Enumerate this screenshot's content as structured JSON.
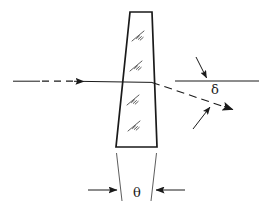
{
  "figure": {
    "kind": "optical-wedge-prism-ray-diagram",
    "canvas": {
      "width": 266,
      "height": 210,
      "background": "#ffffff"
    },
    "stroke_color": "#1a1a1a",
    "labels": {
      "deviation_angle": "δ",
      "wedge_angle": "θ"
    },
    "elements": {
      "prism": {
        "name": "wedge-prism",
        "outline_points": "130,12 152,12 157,147 116,147",
        "stroke_width": 1.6,
        "fill": "none"
      },
      "hatch_marks": [
        {
          "x": 138,
          "y": 36
        },
        {
          "x": 136,
          "y": 66
        },
        {
          "x": 133,
          "y": 100
        },
        {
          "x": 134,
          "y": 126
        }
      ],
      "incident_ray": {
        "name": "incident-ray",
        "solid_start": {
          "x": 13,
          "y": 81
        },
        "solid_end": {
          "x": 40,
          "y": 81
        },
        "dashed_start": {
          "x": 42,
          "y": 81
        },
        "dashed_end": {
          "x": 72,
          "y": 81
        },
        "arrow_tip": {
          "x": 84,
          "y": 81
        },
        "through_end": {
          "x": 152,
          "y": 82
        }
      },
      "reference_line": {
        "name": "optical-axis-reference-line",
        "start": {
          "x": 175,
          "y": 81
        },
        "end": {
          "x": 259,
          "y": 81
        }
      },
      "deviated_ray": {
        "name": "deviated-ray",
        "start": {
          "x": 152,
          "y": 82
        },
        "end": {
          "x": 232,
          "y": 109
        },
        "dash_pattern": "7,4"
      },
      "delta_arrow": {
        "name": "delta-dimension-arrow",
        "tail": {
          "x": 196,
          "y": 57
        },
        "tip": {
          "x": 207,
          "y": 80
        }
      },
      "deviation_arrow": {
        "name": "deviation-indicator-arrow",
        "tail": {
          "x": 194,
          "y": 128
        },
        "tip": {
          "x": 212,
          "y": 105
        }
      },
      "ray_arrowhead": {
        "name": "deviated-ray-arrowhead",
        "tip": {
          "x": 237,
          "y": 110
        }
      },
      "extension_lines": [
        {
          "name": "extension-line-left",
          "x1": 116,
          "y1": 152,
          "x2": 122,
          "y2": 200
        },
        {
          "name": "extension-line-right",
          "x1": 157,
          "y1": 152,
          "x2": 151,
          "y2": 200
        }
      ],
      "theta_dimension": {
        "name": "theta-dimension-arrows",
        "left_arrow": {
          "tail_x": 88,
          "tip_x": 118,
          "y": 190
        },
        "right_arrow": {
          "tail_x": 184,
          "tip_x": 154,
          "y": 190
        }
      }
    }
  }
}
